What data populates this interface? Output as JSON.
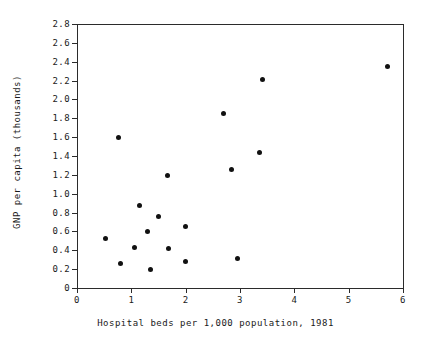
{
  "chart_data": {
    "type": "scatter",
    "title": "",
    "xlabel": "Hospital beds per 1,000 population, 1981",
    "ylabel": "GNP per capita (thousands)",
    "xlim": [
      0,
      6
    ],
    "ylim": [
      0,
      2.8
    ],
    "xticks": [
      0,
      1,
      2,
      3,
      4,
      5,
      6
    ],
    "xtick_labels": [
      "0",
      "1",
      "2",
      "3",
      "4",
      "5",
      "6"
    ],
    "yticks": [
      0,
      0.2,
      0.4,
      0.6,
      0.8,
      1.0,
      1.2,
      1.4,
      1.6,
      1.8,
      2.0,
      2.2,
      2.4,
      2.6,
      2.8
    ],
    "ytick_labels": [
      "0",
      "0.2",
      "0.4",
      "0.6",
      "0.8",
      "1.0",
      "1.2",
      "1.4",
      "1.6",
      "1.8",
      "2.0",
      "2.2",
      "2.4",
      "2.6",
      "2.8"
    ],
    "grid": false,
    "legend": null,
    "marker": "filled-circle",
    "marker_color": "#111111",
    "axis_color": "#2b2b2b",
    "background": "#ffffff",
    "points": [
      {
        "x": 0.53,
        "y": 0.53
      },
      {
        "x": 0.77,
        "y": 1.6
      },
      {
        "x": 0.8,
        "y": 0.26
      },
      {
        "x": 1.05,
        "y": 0.43
      },
      {
        "x": 1.15,
        "y": 0.87
      },
      {
        "x": 1.3,
        "y": 0.6
      },
      {
        "x": 1.36,
        "y": 0.2
      },
      {
        "x": 1.5,
        "y": 0.76
      },
      {
        "x": 1.66,
        "y": 1.19
      },
      {
        "x": 1.68,
        "y": 0.42
      },
      {
        "x": 2.0,
        "y": 0.65
      },
      {
        "x": 2.0,
        "y": 0.28
      },
      {
        "x": 2.69,
        "y": 1.85
      },
      {
        "x": 2.84,
        "y": 1.26
      },
      {
        "x": 2.95,
        "y": 0.31
      },
      {
        "x": 3.35,
        "y": 1.44
      },
      {
        "x": 3.41,
        "y": 2.21
      },
      {
        "x": 5.71,
        "y": 2.35
      }
    ]
  }
}
